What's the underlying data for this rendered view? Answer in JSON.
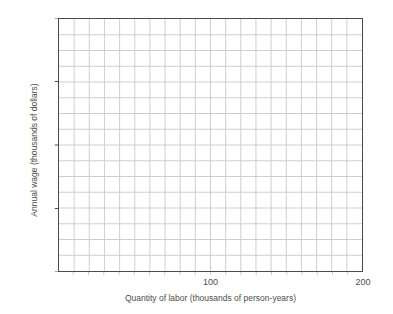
{
  "chart_data": {
    "type": "line",
    "title": "",
    "subtitle": "",
    "xlabel": "Quantity of labor (thousands of person-years)",
    "ylabel": "Annual wage (thousands of dollars)",
    "xlim": [
      0,
      200
    ],
    "ylim": [
      0,
      160
    ],
    "x_tick_labels": [
      "100",
      "200"
    ],
    "x_tick_values": [
      100,
      200
    ],
    "y_tick_labels": [
      "0",
      "40",
      "80",
      "120",
      "160"
    ],
    "y_tick_values": [
      0,
      40,
      80,
      120,
      160
    ],
    "x_gridline_step": 10,
    "y_gridline_step": 10,
    "x_gridline_count": 20,
    "y_gridline_count": 16,
    "grid": true,
    "legend": null,
    "series": [],
    "annotations": [],
    "note": "Empty grid plot with no plotted data series",
    "colors": {
      "grid": "#c9c9c9",
      "axis": "#4a4a4a",
      "text": "#4d4d4d",
      "background": "#ffffff"
    }
  }
}
